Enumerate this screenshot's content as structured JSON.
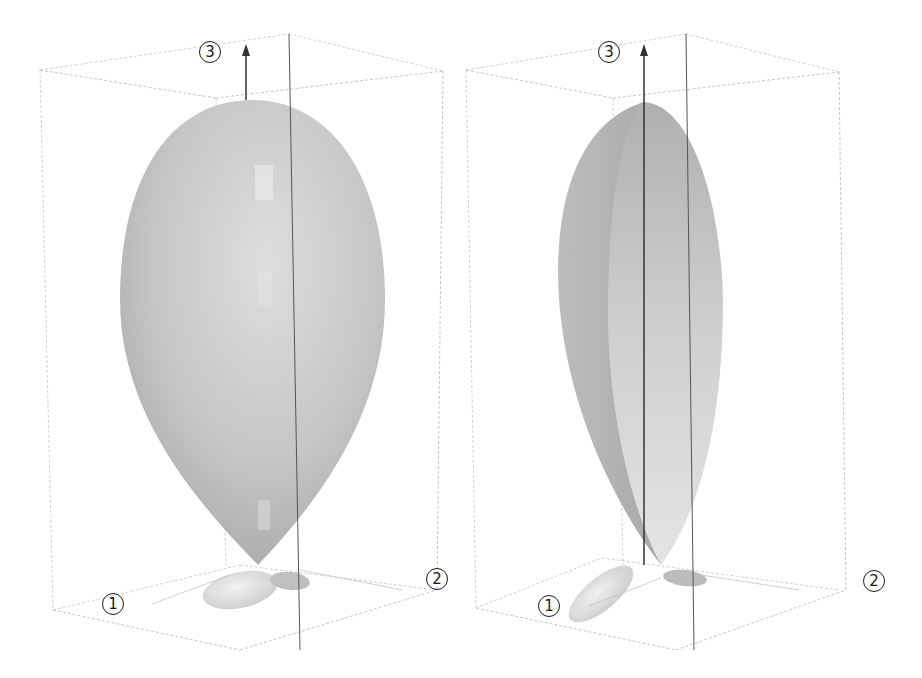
{
  "figure": {
    "panels": [
      {
        "id": "left",
        "description": "full lobe surface",
        "labels": {
          "axis1": "1",
          "axis2": "2",
          "axis3": "3"
        }
      },
      {
        "id": "right",
        "description": "lobe surface cut in half along axis 3",
        "labels": {
          "axis1": "1",
          "axis2": "2",
          "axis3": "3"
        }
      }
    ],
    "colors": {
      "background": "#ffffff",
      "box_edge": "#b8b8b8",
      "axis_arrow": "#333333",
      "surface_light": "#d9d9d9",
      "surface_mid": "#bdbdbd",
      "surface_dark": "#a6a6a6",
      "label": "#1a1a1a"
    }
  }
}
